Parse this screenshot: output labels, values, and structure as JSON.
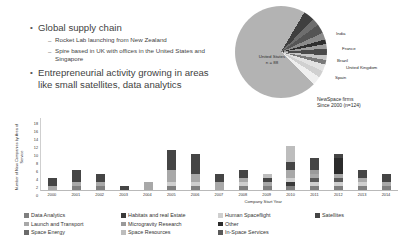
{
  "slide": {
    "bullets": [
      {
        "level": 1,
        "text": "Global supply chain"
      },
      {
        "level": 2,
        "text": "Rocket Lab launching from New Zealand"
      },
      {
        "level": 2,
        "text": "Spire based in UK with offices in the United States and Singapore"
      },
      {
        "level": 1,
        "text": "Entrepreneurial activity growing in areas like small satellites, data analytics"
      }
    ],
    "bullet_glyph": "•",
    "dash_glyph": "–"
  },
  "chart_data": [
    {
      "type": "pie",
      "title": "NewSpace firms",
      "subtitle": "Since 2000 (n=124)",
      "center_label": "United States",
      "center_value": "n = 88",
      "labels": [
        "United States",
        "India",
        "France",
        "Brazil",
        "United Kingdom",
        "Spain"
      ],
      "callout_labels": [
        "India",
        "France",
        "Brazil",
        "United Kingdom",
        "Spain"
      ],
      "values": [
        88,
        4,
        3,
        2,
        2,
        2
      ],
      "slice_colors": [
        "#b3b3b3",
        "#3f3f3f",
        "#6e6e6e",
        "#555555",
        "#8a8a8a",
        "#2e2e2e",
        "#9c9c9c",
        "#4a4a4a",
        "#c6c6c6",
        "#7a7a7a",
        "#e2e2e2",
        "#d0d0d0",
        "#efefef"
      ]
    },
    {
      "type": "bar",
      "stacked": true,
      "title": "",
      "xlabel": "Company Start Year",
      "ylabel": "Number of New Companies by Area of Service",
      "ylim": [
        0,
        18
      ],
      "yticks": [
        0,
        2,
        4,
        6,
        8,
        10,
        12,
        14,
        16,
        18
      ],
      "grid": false,
      "legend_position": "bottom",
      "categories": [
        "2000",
        "2001",
        "2002",
        "2003",
        "2004",
        "2005",
        "2006",
        "2007",
        "2008",
        "2009",
        "2010",
        "2011",
        "2012",
        "2013",
        "2014"
      ],
      "series": [
        {
          "name": "Data Analytics",
          "color": "#7f7f7f",
          "values": [
            0,
            1,
            1,
            0,
            0,
            1,
            1,
            0,
            1,
            1,
            1,
            1,
            1,
            1,
            1
          ]
        },
        {
          "name": "Habitats and real Estate",
          "color": "#3a3a3a",
          "values": [
            0,
            0,
            0,
            0,
            0,
            0,
            0,
            0,
            0,
            0,
            1,
            0,
            0,
            0,
            0
          ]
        },
        {
          "name": "Human Spaceflight",
          "color": "#cfcfcf",
          "values": [
            0,
            0,
            0,
            0,
            0,
            1,
            1,
            0,
            1,
            0,
            1,
            1,
            1,
            1,
            0
          ]
        },
        {
          "name": "In-Space Services",
          "color": "#5a5a5a",
          "values": [
            0,
            0,
            0,
            0,
            0,
            0,
            0,
            0,
            0,
            0,
            0,
            1,
            1,
            0,
            0
          ]
        },
        {
          "name": "Launch and Transport",
          "color": "#a8a8a8",
          "values": [
            1,
            1,
            1,
            0,
            2,
            3,
            2,
            2,
            1,
            1,
            2,
            1,
            1,
            1,
            1
          ]
        },
        {
          "name": "Microgravity Research",
          "color": "#9a9a9a",
          "values": [
            0,
            0,
            0,
            0,
            0,
            0,
            0,
            0,
            0,
            0,
            0,
            1,
            0,
            0,
            0
          ]
        },
        {
          "name": "Other",
          "color": "#2b2b2b",
          "values": [
            0,
            0,
            0,
            0,
            0,
            0,
            0,
            0,
            0,
            0,
            0,
            0,
            4,
            0,
            0
          ]
        },
        {
          "name": "Satellites",
          "color": "#454545",
          "values": [
            2,
            3,
            2,
            1,
            0,
            5,
            5,
            2,
            2,
            1,
            2,
            3,
            1,
            2,
            2
          ]
        },
        {
          "name": "Space Energy",
          "color": "#6b6b6b",
          "values": [
            0,
            0,
            0,
            0,
            0,
            0,
            0,
            0,
            0,
            0,
            0,
            0,
            0,
            0,
            0
          ]
        },
        {
          "name": "Space Resources",
          "color": "#bdbdbd",
          "values": [
            0,
            0,
            0,
            0,
            0,
            0,
            0,
            0,
            0,
            1,
            4,
            0,
            0,
            0,
            0
          ]
        }
      ]
    }
  ],
  "legend": {
    "items": [
      {
        "label": "Data Analytics",
        "color": "#7f7f7f"
      },
      {
        "label": "Launch and Transport",
        "color": "#a8a8a8"
      },
      {
        "label": "Space Energy",
        "color": "#6b6b6b"
      },
      {
        "label": "Habitats and real Estate",
        "color": "#3a3a3a"
      },
      {
        "label": "Microgravity Research",
        "color": "#9a9a9a"
      },
      {
        "label": "Space Resources",
        "color": "#bdbdbd"
      },
      {
        "label": "Human Spaceflight",
        "color": "#cfcfcf"
      },
      {
        "label": "Other",
        "color": "#2b2b2b"
      },
      {
        "label": "In-Space Services",
        "color": "#5a5a5a"
      },
      {
        "label": "Satellites",
        "color": "#454545"
      }
    ]
  }
}
